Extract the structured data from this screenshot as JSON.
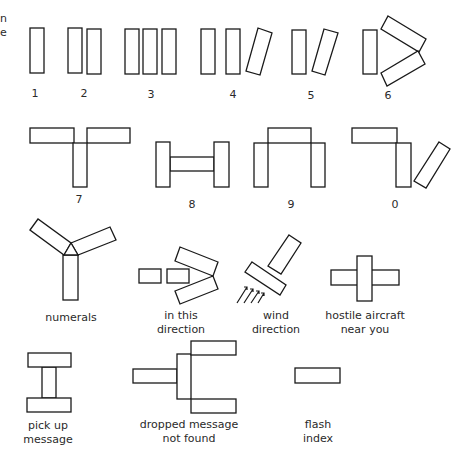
{
  "edge_text": {
    "line1": "n",
    "line2": "e"
  },
  "colors": {
    "stroke": "#1a1a1a",
    "background": "#ffffff",
    "text": "#2a2a2a"
  },
  "symbols": [
    {
      "id": "digit-1",
      "label": [
        "1"
      ],
      "label_pos": [
        35,
        87
      ],
      "shapes": [
        {
          "r": [
            30,
            28,
            14,
            45
          ]
        }
      ]
    },
    {
      "id": "digit-2",
      "label": [
        "2"
      ],
      "label_pos": [
        84,
        87
      ],
      "shapes": [
        {
          "r": [
            68,
            28,
            14,
            45
          ]
        },
        {
          "r": [
            87,
            29,
            14,
            45
          ]
        }
      ]
    },
    {
      "id": "digit-3",
      "label": [
        "3"
      ],
      "label_pos": [
        151,
        88
      ],
      "shapes": [
        {
          "r": [
            125,
            29,
            14,
            45
          ]
        },
        {
          "r": [
            143,
            29,
            14,
            45
          ]
        },
        {
          "r": [
            162,
            29,
            14,
            45
          ]
        }
      ]
    },
    {
      "id": "digit-4",
      "label": [
        "4"
      ],
      "label_pos": [
        233,
        88
      ],
      "shapes": [
        {
          "r": [
            201,
            29,
            14,
            45
          ]
        },
        {
          "r": [
            226,
            29,
            14,
            45
          ]
        },
        {
          "p": [
            [
              258,
              28
            ],
            [
              272,
              33
            ],
            [
              260,
              75
            ],
            [
              246,
              71
            ]
          ]
        }
      ]
    },
    {
      "id": "digit-5",
      "label": [
        "5"
      ],
      "label_pos": [
        311,
        89
      ],
      "shapes": [
        {
          "r": [
            292,
            30,
            14,
            44
          ]
        },
        {
          "p": [
            [
              324,
              29
            ],
            [
              338,
              33
            ],
            [
              325,
              75
            ],
            [
              312,
              71
            ]
          ]
        }
      ]
    },
    {
      "id": "digit-6",
      "label": [
        "6"
      ],
      "label_pos": [
        388,
        89
      ],
      "shapes": [
        {
          "r": [
            363,
            30,
            14,
            44
          ]
        },
        {
          "p": [
            [
              388,
              16
            ],
            [
              426,
              39
            ],
            [
              419,
              52
            ],
            [
              381,
              29
            ]
          ]
        },
        {
          "p": [
            [
              381,
              73
            ],
            [
              418,
              51
            ],
            [
              425,
              64
            ],
            [
              387,
              86
            ]
          ]
        }
      ]
    },
    {
      "id": "digit-7",
      "label": [
        "7"
      ],
      "label_pos": [
        79,
        193
      ],
      "shapes": [
        {
          "r": [
            30,
            128,
            44,
            15
          ]
        },
        {
          "r": [
            87,
            128,
            43,
            15
          ]
        },
        {
          "r": [
            73,
            143,
            14,
            44
          ]
        }
      ]
    },
    {
      "id": "digit-8",
      "label": [
        "8"
      ],
      "label_pos": [
        192,
        198
      ],
      "shapes": [
        {
          "r": [
            170,
            157,
            44,
            14
          ]
        },
        {
          "r": [
            156,
            142,
            14,
            45
          ]
        },
        {
          "r": [
            214,
            142,
            15,
            45
          ]
        }
      ]
    },
    {
      "id": "digit-9",
      "label": [
        "9"
      ],
      "label_pos": [
        291,
        198
      ],
      "shapes": [
        {
          "r": [
            268,
            128,
            43,
            15
          ]
        },
        {
          "r": [
            254,
            143,
            14,
            44
          ]
        },
        {
          "r": [
            311,
            143,
            14,
            44
          ]
        }
      ]
    },
    {
      "id": "digit-0",
      "label": [
        "0"
      ],
      "label_pos": [
        395,
        198
      ],
      "shapes": [
        {
          "r": [
            352,
            128,
            45,
            15
          ]
        },
        {
          "r": [
            396,
            143,
            15,
            44
          ]
        },
        {
          "p": [
            [
              439,
              142
            ],
            [
              450,
              149
            ],
            [
              426,
              188
            ],
            [
              414,
              181
            ]
          ]
        }
      ]
    },
    {
      "id": "numerals",
      "label": [
        "numerals"
      ],
      "label_pos": [
        71,
        311
      ],
      "shapes": [
        {
          "r": [
            63,
            255,
            15,
            45
          ]
        },
        {
          "p": [
            [
              30,
              230
            ],
            [
              38,
              219
            ],
            [
              71,
              243
            ],
            [
              64,
              255
            ]
          ]
        },
        {
          "p": [
            [
              71,
              243
            ],
            [
              110,
              227
            ],
            [
              116,
              240
            ],
            [
              78,
              255
            ]
          ]
        },
        {
          "p": [
            [
              64,
              255
            ],
            [
              71,
              243
            ],
            [
              78,
              255
            ]
          ]
        }
      ]
    },
    {
      "id": "in-this-direction",
      "label": [
        "in this",
        "direction"
      ],
      "label_pos": [
        181,
        309
      ],
      "shapes": [
        {
          "r": [
            139,
            269,
            22,
            14
          ]
        },
        {
          "r": [
            167,
            269,
            22,
            14
          ]
        },
        {
          "p": [
            [
              180,
              247
            ],
            [
              218,
              262
            ],
            [
              213,
              276
            ],
            [
              175,
              261
            ]
          ]
        },
        {
          "p": [
            [
              175,
              291
            ],
            [
              213,
              276
            ],
            [
              218,
              289
            ],
            [
              180,
              304
            ]
          ]
        }
      ]
    },
    {
      "id": "wind-direction",
      "label": [
        "wind",
        "direction"
      ],
      "label_pos": [
        276,
        309
      ],
      "shapes": [
        {
          "p": [
            [
              289,
              235
            ],
            [
              301,
              243
            ],
            [
              281,
              274
            ],
            [
              268,
              266
            ]
          ]
        },
        {
          "p": [
            [
              252,
              262
            ],
            [
              286,
              285
            ],
            [
              280,
              295
            ],
            [
              245,
              272
            ]
          ]
        },
        {
          "hatch": "M237,303 L247,287 M244,287 L247,287 L247,290 M244,303 L253,289 M250,289 L253,289 L253,292 M251,303 L259,291 M256,291 L259,291 L259,294 M258,303 L264,293 M261,293 L264,293 L264,296"
        }
      ]
    },
    {
      "id": "hostile-aircraft-near-you",
      "label": [
        "hostile aircraft",
        "near you"
      ],
      "label_pos": [
        365,
        309
      ],
      "shapes": [
        {
          "r": [
            331,
            270,
            68,
            15
          ]
        },
        {
          "r": [
            357,
            256,
            15,
            45
          ]
        }
      ]
    },
    {
      "id": "pick-up-message",
      "label": [
        "pick up",
        "message"
      ],
      "label_pos": [
        48,
        419
      ],
      "shapes": [
        {
          "r": [
            42,
            367,
            14,
            31
          ]
        },
        {
          "r": [
            28,
            353,
            43,
            14
          ]
        },
        {
          "r": [
            27,
            398,
            44,
            14
          ]
        }
      ]
    },
    {
      "id": "dropped-message-not-found",
      "label": [
        "dropped message",
        "not found"
      ],
      "label_pos": [
        189,
        418
      ],
      "shapes": [
        {
          "r": [
            133,
            369,
            44,
            14
          ]
        },
        {
          "r": [
            177,
            354,
            14,
            45
          ]
        },
        {
          "r": [
            191,
            341,
            45,
            14
          ]
        },
        {
          "r": [
            191,
            399,
            45,
            14
          ]
        }
      ]
    },
    {
      "id": "flash-index",
      "label": [
        "flash",
        "index"
      ],
      "label_pos": [
        318,
        418
      ],
      "shapes": [
        {
          "r": [
            295,
            368,
            45,
            15
          ]
        }
      ]
    }
  ]
}
